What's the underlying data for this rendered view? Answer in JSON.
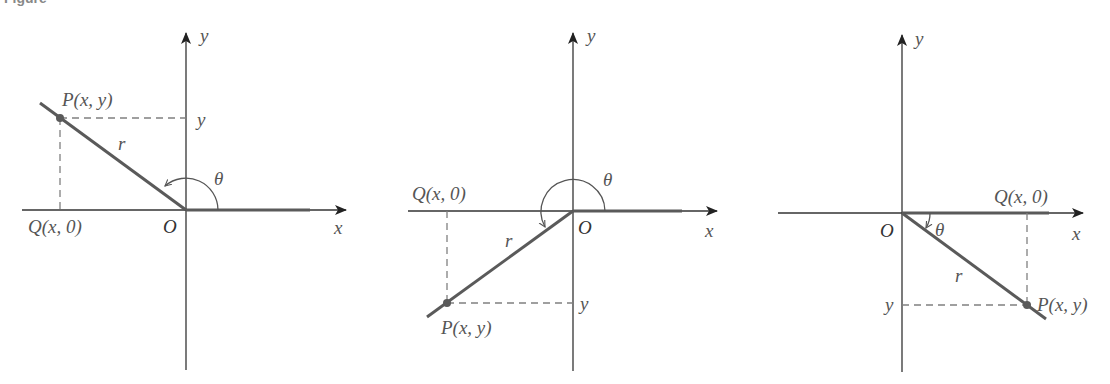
{
  "figure": {
    "caption_fragment": "Figure",
    "colors": {
      "axis": "#333333",
      "terminal_ray": "#5a5a5a",
      "dashed": "#808080",
      "label": "#555555",
      "background": "#ffffff"
    },
    "panels": [
      {
        "name": "quadrant-II",
        "x_axis_label": "x",
        "y_axis_label": "y",
        "origin_label": "O",
        "point_label": "P(x, y)",
        "foot_label": "Q(x, 0)",
        "y_tick_label": "y",
        "radius_label": "r",
        "angle_label": "θ"
      },
      {
        "name": "quadrant-III",
        "x_axis_label": "x",
        "y_axis_label": "y",
        "origin_label": "O",
        "point_label": "P(x, y)",
        "foot_label": "Q(x, 0)",
        "y_tick_label": "y",
        "radius_label": "r",
        "angle_label": "θ"
      },
      {
        "name": "quadrant-IV",
        "x_axis_label": "x",
        "y_axis_label": "y",
        "origin_label": "O",
        "point_label": "P(x, y)",
        "foot_label": "Q(x, 0)",
        "y_tick_label": "y",
        "radius_label": "r",
        "angle_label": "θ"
      }
    ]
  }
}
